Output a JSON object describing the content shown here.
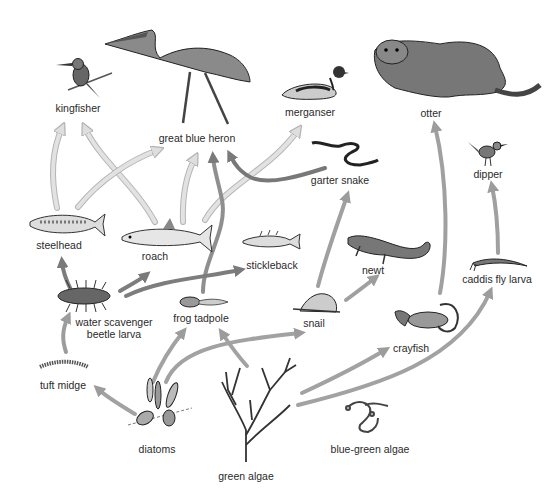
{
  "diagram": {
    "colors": {
      "arrow_light": "#dcdcdc",
      "arrow_light_edge": "#b8b8b8",
      "arrow_medium": "#9a9a9a",
      "arrow_dark": "#7a7a7a",
      "text": "#2a2a2a",
      "background": "#ffffff"
    },
    "organisms": {
      "kingfisher": {
        "label": "kingfisher",
        "icon": "kingfisher-icon"
      },
      "heron": {
        "label": "great blue heron",
        "icon": "heron-icon"
      },
      "merganser": {
        "label": "merganser",
        "icon": "merganser-icon"
      },
      "otter": {
        "label": "otter",
        "icon": "otter-icon"
      },
      "garter_snake": {
        "label": "garter snake",
        "icon": "snake-icon"
      },
      "dipper": {
        "label": "dipper",
        "icon": "dipper-icon"
      },
      "steelhead": {
        "label": "steelhead",
        "icon": "fish-icon"
      },
      "roach": {
        "label": "roach",
        "icon": "fish-icon"
      },
      "stickleback": {
        "label": "stickleback",
        "icon": "fish-icon"
      },
      "newt": {
        "label": "newt",
        "icon": "newt-icon"
      },
      "caddis": {
        "label": "caddis fly larva",
        "icon": "larva-icon"
      },
      "beetle_larva": {
        "label_line1": "water scavenger",
        "label_line2": "beetle larva",
        "icon": "beetle-larva-icon"
      },
      "tadpole": {
        "label": "frog tadpole",
        "icon": "tadpole-icon"
      },
      "snail": {
        "label": "snail",
        "icon": "snail-icon"
      },
      "crayfish": {
        "label": "crayfish",
        "icon": "crayfish-icon"
      },
      "tuft_midge": {
        "label": "tuft midge",
        "icon": "midge-larva-icon"
      },
      "diatoms": {
        "label": "diatoms",
        "icon": "diatoms-icon"
      },
      "green_algae": {
        "label": "green algae",
        "icon": "green-algae-icon"
      },
      "blue_green_algae": {
        "label": "blue-green algae",
        "icon": "blue-green-algae-icon"
      }
    },
    "links": [
      {
        "from": "steelhead",
        "to": "kingfisher",
        "shade": "light"
      },
      {
        "from": "roach",
        "to": "kingfisher",
        "shade": "light"
      },
      {
        "from": "steelhead",
        "to": "great blue heron",
        "shade": "light"
      },
      {
        "from": "roach",
        "to": "great blue heron",
        "shade": "light"
      },
      {
        "from": "frog tadpole",
        "to": "great blue heron",
        "shade": "medium"
      },
      {
        "from": "garter snake",
        "to": "great blue heron",
        "shade": "dark"
      },
      {
        "from": "roach",
        "to": "merganser",
        "shade": "light"
      },
      {
        "from": "crayfish",
        "to": "otter",
        "shade": "medium"
      },
      {
        "from": "caddis fly larva",
        "to": "dipper",
        "shade": "medium"
      },
      {
        "from": "snail",
        "to": "garter snake",
        "shade": "medium"
      },
      {
        "from": "snail",
        "to": "newt",
        "shade": "medium"
      },
      {
        "from": "water scavenger beetle larva",
        "to": "steelhead",
        "shade": "dark"
      },
      {
        "from": "water scavenger beetle larva",
        "to": "roach",
        "shade": "dark"
      },
      {
        "from": "water scavenger beetle larva",
        "to": "stickleback",
        "shade": "dark"
      },
      {
        "from": "tuft midge",
        "to": "water scavenger beetle larva",
        "shade": "medium"
      },
      {
        "from": "diatoms",
        "to": "tuft midge",
        "shade": "medium"
      },
      {
        "from": "diatoms",
        "to": "frog tadpole",
        "shade": "medium"
      },
      {
        "from": "diatoms",
        "to": "snail",
        "shade": "medium"
      },
      {
        "from": "green algae",
        "to": "frog tadpole",
        "shade": "medium"
      },
      {
        "from": "green algae",
        "to": "crayfish",
        "shade": "medium"
      },
      {
        "from": "green algae",
        "to": "caddis fly larva",
        "shade": "medium"
      }
    ]
  }
}
